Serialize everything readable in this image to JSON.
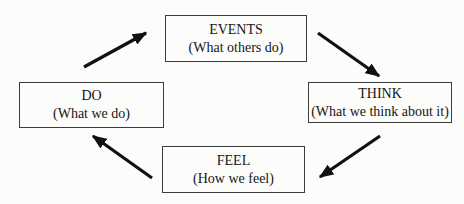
{
  "diagram": {
    "type": "cycle",
    "nodes": {
      "events": {
        "title": "EVENTS",
        "subtitle": "(What others do)"
      },
      "think": {
        "title": "THINK",
        "subtitle": "(What we think about it)"
      },
      "feel": {
        "title": "FEEL",
        "subtitle": "(How we feel)"
      },
      "do": {
        "title": "DO",
        "subtitle": "(What we do)"
      }
    },
    "edges": [
      {
        "from": "do",
        "to": "events"
      },
      {
        "from": "events",
        "to": "think"
      },
      {
        "from": "think",
        "to": "feel"
      },
      {
        "from": "feel",
        "to": "do"
      }
    ],
    "colors": {
      "background": "#fcfcfb",
      "box_border": "#3d3d3d",
      "text": "#151515",
      "arrow": "#111111"
    }
  }
}
